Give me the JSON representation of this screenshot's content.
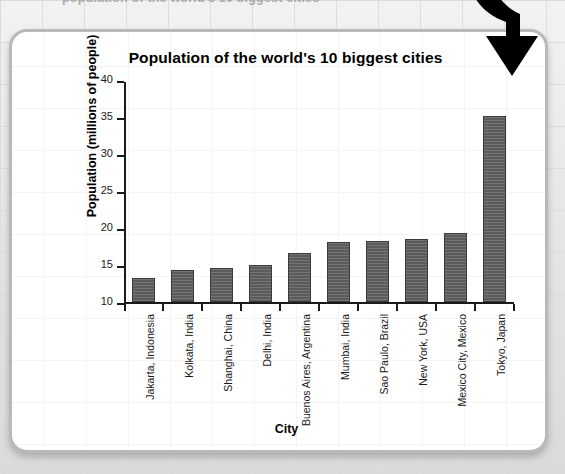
{
  "page": {
    "top_clipped_text": "population of the world's 10 biggest cities",
    "background_color": "#e4e4e4",
    "card_background": "#ffffff",
    "card_border_color": "#b9b9b9"
  },
  "annotation": {
    "arrow_icon": "down-arrow-icon",
    "arrow_color": "#000000"
  },
  "chart_data": {
    "type": "bar",
    "title": "Population of the world's 10 biggest cities",
    "xlabel": "City",
    "ylabel": "Population (millions of people)",
    "categories": [
      "Jakarta, Indonesia",
      "Kolkata, India",
      "Shanghai, China",
      "Delhi, India",
      "Buenos Aires, Argentina",
      "Mumbai, India",
      "Sao Paulo, Brazil",
      "New York, USA",
      "Mexico City, Mexico",
      "Tokyo, Japan"
    ],
    "values": [
      13.2,
      14.3,
      14.6,
      15.0,
      16.6,
      18.1,
      18.2,
      18.5,
      19.3,
      35.1
    ],
    "ylim": [
      10,
      40
    ],
    "yticks": [
      10,
      15,
      20,
      25,
      30,
      35,
      40
    ],
    "ytick_labels": [
      "10",
      "15",
      "20",
      "25",
      "30",
      "35",
      "40"
    ],
    "grid": false,
    "legend": "none",
    "bar_color": "#5b5b5b",
    "bar_border_color": "#3a3a3a",
    "axis_color": "#1a1a1a"
  }
}
